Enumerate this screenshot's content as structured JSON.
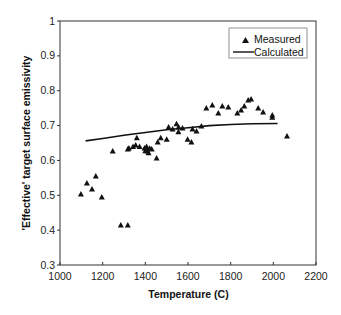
{
  "chart_data": {
    "type": "scatter",
    "title": "",
    "xlabel": "Temperature (C)",
    "ylabel": "'Effective' target surface emissivity",
    "xlim": [
      1000,
      2200
    ],
    "ylim": [
      0.3,
      1
    ],
    "xticks": [
      1000,
      1200,
      1400,
      1600,
      1800,
      2000,
      2200
    ],
    "yticks": [
      0.3,
      0.4,
      0.5,
      0.6,
      0.7,
      0.8,
      0.9,
      1
    ],
    "ytick_labels": [
      "0.3",
      "0.4",
      "0.5",
      "0.6",
      "0.7",
      "0.8",
      "0.9",
      "1"
    ],
    "grid": false,
    "legend_position": "upper right",
    "series": [
      {
        "name": "Measured",
        "kind": "scatter",
        "marker": "triangle",
        "color": "#111111",
        "points": [
          [
            1098,
            0.504
          ],
          [
            1126,
            0.535
          ],
          [
            1150,
            0.518
          ],
          [
            1168,
            0.555
          ],
          [
            1196,
            0.495
          ],
          [
            1247,
            0.627
          ],
          [
            1285,
            0.415
          ],
          [
            1318,
            0.415
          ],
          [
            1318,
            0.633
          ],
          [
            1323,
            0.636
          ],
          [
            1342,
            0.64
          ],
          [
            1355,
            0.644
          ],
          [
            1360,
            0.665
          ],
          [
            1373,
            0.64
          ],
          [
            1396,
            0.636
          ],
          [
            1400,
            0.628
          ],
          [
            1406,
            0.64
          ],
          [
            1410,
            0.627
          ],
          [
            1415,
            0.622
          ],
          [
            1420,
            0.635
          ],
          [
            1430,
            0.633
          ],
          [
            1453,
            0.607
          ],
          [
            1458,
            0.653
          ],
          [
            1472,
            0.665
          ],
          [
            1500,
            0.661
          ],
          [
            1509,
            0.696
          ],
          [
            1528,
            0.69
          ],
          [
            1546,
            0.705
          ],
          [
            1555,
            0.682
          ],
          [
            1556,
            0.696
          ],
          [
            1574,
            0.693
          ],
          [
            1598,
            0.661
          ],
          [
            1616,
            0.653
          ],
          [
            1621,
            0.69
          ],
          [
            1640,
            0.684
          ],
          [
            1663,
            0.699
          ],
          [
            1686,
            0.75
          ],
          [
            1714,
            0.759
          ],
          [
            1742,
            0.736
          ],
          [
            1761,
            0.756
          ],
          [
            1789,
            0.753
          ],
          [
            1831,
            0.736
          ],
          [
            1849,
            0.745
          ],
          [
            1864,
            0.756
          ],
          [
            1882,
            0.773
          ],
          [
            1896,
            0.776
          ],
          [
            1929,
            0.75
          ],
          [
            1952,
            0.739
          ],
          [
            1995,
            0.73
          ],
          [
            1995,
            0.724
          ],
          [
            2064,
            0.67
          ]
        ]
      },
      {
        "name": "Calculated",
        "kind": "line",
        "color": "#111111",
        "points": [
          [
            1120,
            0.656
          ],
          [
            1200,
            0.663
          ],
          [
            1300,
            0.672
          ],
          [
            1400,
            0.68
          ],
          [
            1500,
            0.688
          ],
          [
            1600,
            0.694
          ],
          [
            1700,
            0.7
          ],
          [
            1800,
            0.703
          ],
          [
            1900,
            0.705
          ],
          [
            2020,
            0.706
          ]
        ]
      }
    ]
  },
  "legend": {
    "items": [
      {
        "label": "Measured",
        "symbol": "triangle"
      },
      {
        "label": "Calculated",
        "symbol": "line"
      }
    ]
  },
  "colors": {
    "axis": "#333333",
    "marker": "#111111",
    "line": "#111111",
    "background": "#ffffff"
  }
}
